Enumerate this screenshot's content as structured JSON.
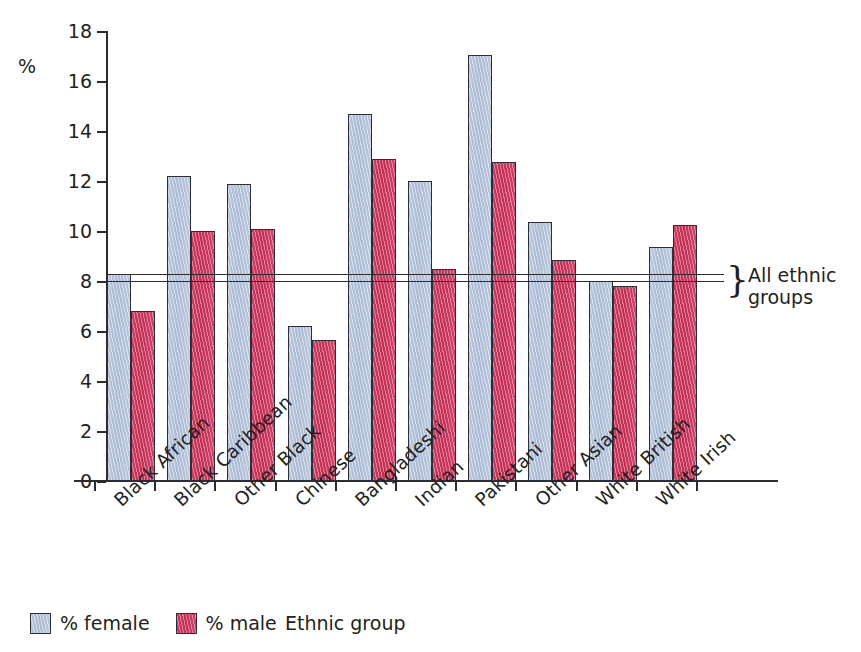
{
  "chart_data": {
    "type": "bar",
    "title": "",
    "xlabel": "Ethnic group",
    "ylabel": "%",
    "ylim": [
      0,
      18
    ],
    "ytick_step": 2,
    "yticks": [
      18,
      16,
      14,
      12,
      10,
      8,
      6,
      4,
      2,
      0
    ],
    "grid": false,
    "legend_position": "bottom-left",
    "categories": [
      "Black African",
      "Black Caribbean",
      "Other Black",
      "Chinese",
      "Bangladeshi",
      "Indian",
      "Pakistani",
      "Other Asian",
      "White British",
      "White Irish"
    ],
    "series": [
      {
        "name": "% female",
        "color": "#adbdd6",
        "values": [
          8.3,
          12.2,
          11.9,
          6.2,
          14.7,
          12.0,
          17.05,
          10.35,
          8.0,
          9.35
        ]
      },
      {
        "name": "% male",
        "color": "#c8355c",
        "values": [
          6.8,
          10.0,
          10.1,
          5.65,
          12.9,
          8.5,
          12.75,
          8.85,
          7.8,
          10.25
        ]
      }
    ],
    "reference_lines": [
      {
        "label": "All ethnic groups (female)",
        "value": 8.3
      },
      {
        "label": "All ethnic groups (male)",
        "value": 8.0
      }
    ],
    "annotations": [
      {
        "text_line_1": "All ethnic",
        "text_line_2": "groups",
        "brace": "}"
      }
    ]
  },
  "axis": {
    "y_unit_symbol": "%",
    "x_title": "Ethnic group"
  },
  "legend": {
    "items": [
      {
        "label": "% female",
        "color": "#adbdd6"
      },
      {
        "label": "% male",
        "color": "#c8355c"
      }
    ]
  }
}
